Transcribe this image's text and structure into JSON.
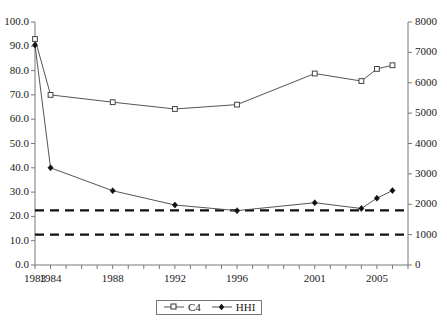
{
  "chart_data": {
    "type": "line",
    "title": "",
    "xlabel": "",
    "ylabel": "",
    "x": [
      1983,
      1984,
      1988,
      1992,
      1996,
      2001,
      2004,
      2005,
      2006
    ],
    "xlim": [
      1983,
      2007
    ],
    "xtick_labels": [
      "1983",
      "1984",
      "1988",
      "1992",
      "1996",
      "2001",
      "2005"
    ],
    "xtick_values": [
      1983,
      1984,
      1988,
      1992,
      1996,
      2001,
      2005
    ],
    "grid": false,
    "legend_position": "bottom-center",
    "series": [
      {
        "name": "C4",
        "axis": "left",
        "marker": "square-open",
        "values": [
          93.0,
          70.0,
          67.0,
          64.2,
          66.0,
          78.8,
          75.7,
          80.7,
          82.2
        ]
      },
      {
        "name": "HHI",
        "axis": "right",
        "marker": "diamond-filled",
        "values": [
          7240,
          3200,
          2445,
          1975,
          1790,
          2050,
          1860,
          2200,
          2450
        ]
      }
    ],
    "left_axis": {
      "label": "",
      "ylim": [
        0.0,
        100.0
      ],
      "tick_step": 10.0,
      "tick_labels": [
        "0.0",
        "10.0",
        "20.0",
        "30.0",
        "40.0",
        "50.0",
        "60.0",
        "70.0",
        "80.0",
        "90.0",
        "100.0"
      ],
      "tick_values": [
        0.0,
        10.0,
        20.0,
        30.0,
        40.0,
        50.0,
        60.0,
        70.0,
        80.0,
        90.0,
        100.0
      ]
    },
    "right_axis": {
      "label": "",
      "ylim": [
        0,
        8000
      ],
      "tick_step": 1000,
      "tick_labels": [
        "0",
        "1000",
        "2000",
        "3000",
        "4000",
        "5000",
        "6000",
        "7000",
        "8000"
      ],
      "tick_values": [
        0,
        1000,
        2000,
        3000,
        4000,
        5000,
        6000,
        7000,
        8000
      ]
    },
    "reference_lines": [
      {
        "name": "hhi-threshold-upper",
        "axis": "right",
        "value": 1800,
        "style": "dashed"
      },
      {
        "name": "hhi-threshold-lower",
        "axis": "right",
        "value": 1000,
        "style": "dashed"
      }
    ],
    "colors": {
      "c4_line": "#555555",
      "hhi_line": "#555555",
      "reference_line": "#111111",
      "axis": "#777777",
      "text": "#1a1a1a",
      "background": "#ffffff"
    }
  },
  "legend": {
    "entries": [
      {
        "label": "C4"
      },
      {
        "label": "HHI"
      }
    ]
  }
}
